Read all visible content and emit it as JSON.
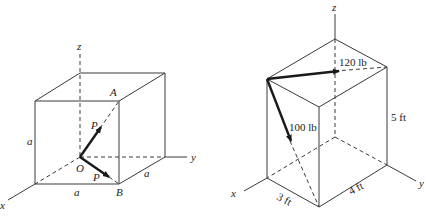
{
  "figure_left": {
    "title": "Cube with two forces P",
    "axes": {
      "x": "x",
      "y": "y",
      "z": "z"
    },
    "points": {
      "A": "A",
      "B": "B",
      "O": "O"
    },
    "forces": [
      {
        "label": "P",
        "from": "O",
        "toward": "A"
      },
      {
        "label": "P",
        "from": "O",
        "toward": "B"
      }
    ],
    "dimensions": {
      "height": "a",
      "width": "a",
      "depth": "a"
    }
  },
  "figure_right": {
    "title": "Rectangular box with two forces",
    "axes": {
      "x": "x",
      "y": "y",
      "z": "z"
    },
    "forces": [
      {
        "label": "120 lb"
      },
      {
        "label": "100 lb"
      }
    ],
    "dimensions": {
      "height": "5 ft",
      "width": "4 ft",
      "depth": "3 ft"
    }
  }
}
